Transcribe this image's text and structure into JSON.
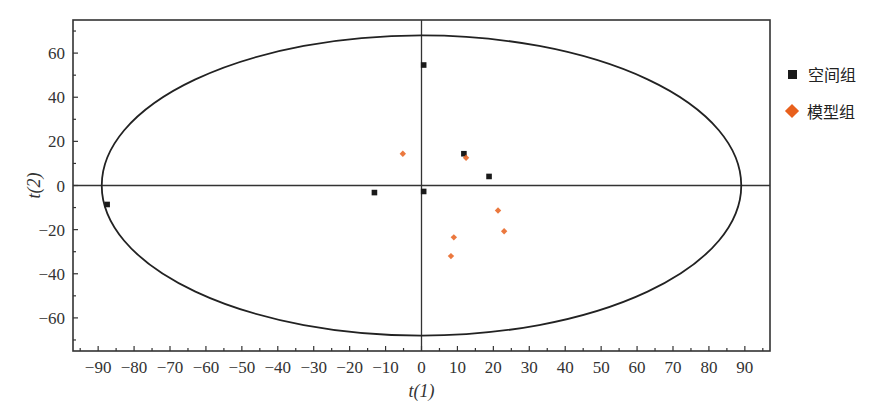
{
  "chart_data": {
    "type": "scatter",
    "title": "",
    "xlabel": "t(1)",
    "ylabel": "t(2)",
    "xlim": [
      -97,
      97
    ],
    "ylim": [
      -75,
      75
    ],
    "xticks": [
      -90,
      -80,
      -70,
      -60,
      -50,
      -40,
      -30,
      -20,
      -10,
      0,
      10,
      20,
      30,
      40,
      50,
      60,
      70,
      80,
      90
    ],
    "xtick_labels": [
      "−90",
      "−80",
      "−70",
      "−60",
      "−50",
      "−40",
      "−30",
      "−20",
      "−10",
      "0",
      "10",
      "20",
      "30",
      "40",
      "50",
      "60",
      "70",
      "80",
      "90"
    ],
    "x_minor_step": 5,
    "yticks": [
      -60,
      -40,
      -20,
      0,
      20,
      40,
      60
    ],
    "ytick_labels": [
      "−60",
      "−40",
      "−20",
      "0",
      "20",
      "40",
      "60"
    ],
    "y_minor_step": 10,
    "grid": false,
    "zero_lines": true,
    "confidence_ellipse": {
      "center": [
        0,
        0
      ],
      "semi_x": 89,
      "semi_y": 68
    },
    "legend_position": "right",
    "series": [
      {
        "name": "空间组",
        "marker": "square",
        "color": "#1a1a1a",
        "points": [
          {
            "x": 0.6,
            "y": 54.6
          },
          {
            "x": 11.8,
            "y": 14.4
          },
          {
            "x": 18.8,
            "y": 4.1
          },
          {
            "x": -13.1,
            "y": -3.2
          },
          {
            "x": 0.6,
            "y": -2.7
          },
          {
            "x": -87.5,
            "y": -8.6
          }
        ]
      },
      {
        "name": "模型组",
        "marker": "diamond",
        "color": "#e8601c",
        "points": [
          {
            "x": -5.2,
            "y": 14.4
          },
          {
            "x": 12.4,
            "y": 12.6
          },
          {
            "x": 21.3,
            "y": -11.3
          },
          {
            "x": 23.0,
            "y": -20.7
          },
          {
            "x": 9.0,
            "y": -23.5
          },
          {
            "x": 8.2,
            "y": -32.0
          }
        ]
      }
    ]
  }
}
